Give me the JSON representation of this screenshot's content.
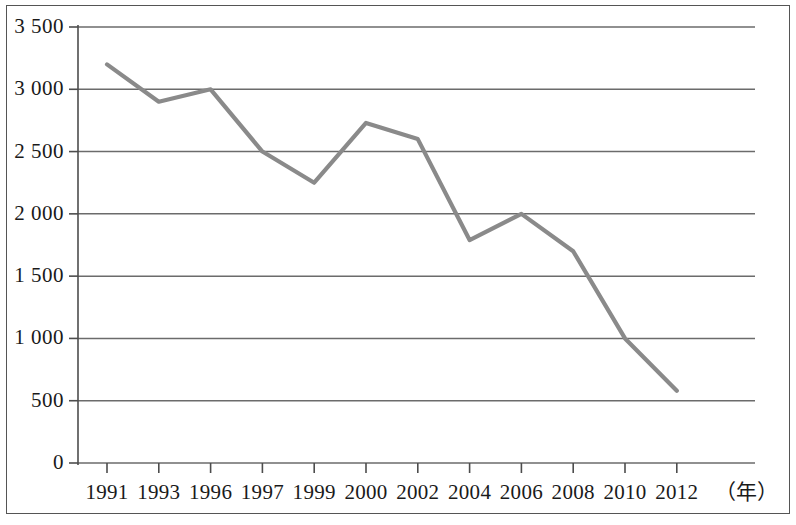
{
  "chart_data": {
    "type": "line",
    "title": "",
    "subtitle": "",
    "xlabel": "（年）",
    "ylabel": "",
    "grid": true,
    "legend": null,
    "legend_position": "none",
    "xlim": [
      1990,
      2013
    ],
    "ylim": [
      0,
      3500
    ],
    "y_ticks": [
      0,
      500,
      1000,
      1500,
      2000,
      2500,
      3000,
      3500
    ],
    "y_tick_labels": [
      "0",
      "500",
      "1 000",
      "1 500",
      "2 000",
      "2 500",
      "3 000",
      "3 500"
    ],
    "x_tick_labels": [
      "1991",
      "1993",
      "1996",
      "1997",
      "1999",
      "2000",
      "2002",
      "2004",
      "2006",
      "2008",
      "2010",
      "2012"
    ],
    "x": [
      1991,
      1993,
      1996,
      1997,
      1999,
      2000,
      2002,
      2004,
      2006,
      2008,
      2010,
      2012
    ],
    "values": [
      3200,
      2900,
      3000,
      2500,
      2250,
      2730,
      2600,
      1790,
      2000,
      1700,
      1000,
      580
    ],
    "series": [
      {
        "name": "",
        "color": "#8a8a8a",
        "values": [
          3200,
          2900,
          3000,
          2500,
          2250,
          2730,
          2600,
          1790,
          2000,
          1700,
          1000,
          580
        ]
      }
    ],
    "colors": {
      "line": "#8a8a8a",
      "grid": "#6b6b6b",
      "axis": "#4d4d4d",
      "frame": "#555555",
      "text": "#1a1a1a",
      "background": "#ffffff"
    }
  }
}
